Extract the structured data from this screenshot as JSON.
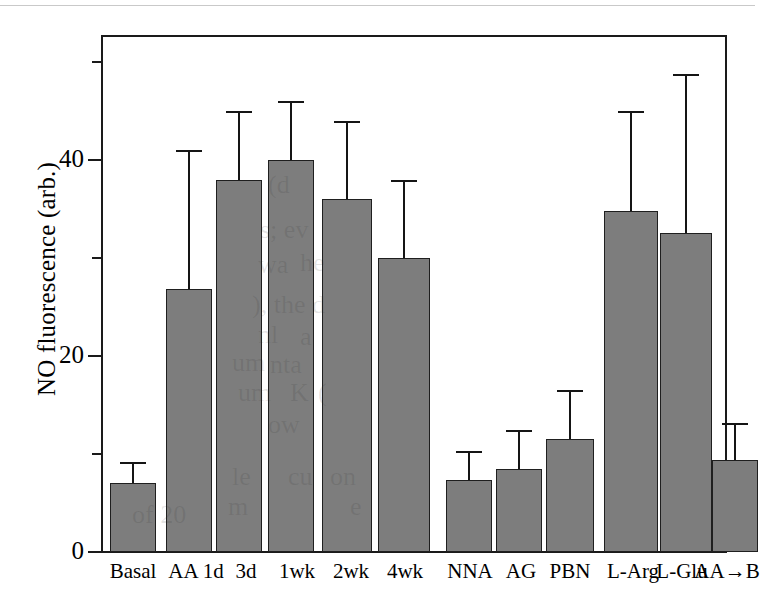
{
  "chart_data": {
    "type": "bar",
    "title": "",
    "xlabel": "",
    "ylabel": "NO fluorescence (arb.)",
    "ylim": [
      0,
      53
    ],
    "ytick_values": [
      0,
      20,
      40
    ],
    "ytick_labels": [
      "0",
      "20",
      "40"
    ],
    "yminor_tick_values": [
      10,
      30,
      50
    ],
    "grid": false,
    "legend": "none",
    "error_bars": "upper only (SEM/SD caps)",
    "groups": [
      {
        "name": "time-course",
        "categories": [
          "Basal",
          "AA 1d",
          "3d",
          "1wk",
          "2wk",
          "4wk"
        ],
        "values": [
          7.0,
          26.8,
          38.0,
          40.0,
          36.0,
          30.0
        ],
        "errors_upper": [
          9.2,
          41.0,
          45.0,
          46.0,
          44.0,
          38.0
        ]
      },
      {
        "name": "inhibitors",
        "categories": [
          "NNA",
          "AG",
          "PBN"
        ],
        "values": [
          7.3,
          8.5,
          11.5
        ],
        "errors_upper": [
          10.3,
          12.5,
          16.5
        ]
      },
      {
        "name": "substrates",
        "categories": [
          "L-Arg",
          "L-Glu",
          "AA→B"
        ],
        "values": [
          34.8,
          32.6,
          9.4
        ],
        "errors_upper": [
          45.0,
          48.8,
          13.2
        ]
      }
    ],
    "categories_all": [
      "Basal",
      "AA 1d",
      "3d",
      "1wk",
      "2wk",
      "4wk",
      "NNA",
      "AG",
      "PBN",
      "L-Arg",
      "L-Glu",
      "AA→B"
    ],
    "values_all": [
      7.0,
      26.8,
      38.0,
      40.0,
      36.0,
      30.0,
      7.3,
      8.5,
      11.5,
      34.8,
      32.6,
      9.4
    ],
    "errors_upper_all": [
      9.2,
      41.0,
      45.0,
      46.0,
      44.0,
      38.0,
      10.3,
      12.5,
      16.5,
      45.0,
      48.8,
      13.2
    ],
    "colors": {
      "bar_fill": "#7d7d7d",
      "bar_edge": "#1f1f1f",
      "axis": "#1a1a1a",
      "background": "#ffffff",
      "error_bar": "#151515"
    }
  },
  "xtick_labels": [
    {
      "text": "Basal",
      "center": 133
    },
    {
      "text": "AA 1d",
      "center": 196
    },
    {
      "text": "3d",
      "center": 246
    },
    {
      "text": "1wk",
      "center": 297
    },
    {
      "text": "2wk",
      "center": 351
    },
    {
      "text": "4wk",
      "center": 405
    },
    {
      "text": "NNA",
      "center": 470
    },
    {
      "text": "AG",
      "center": 521
    },
    {
      "text": "PBN",
      "center": 570
    },
    {
      "text": "L-Arg",
      "center": 633
    },
    {
      "text": "L-Glu",
      "center": 682
    },
    {
      "text": "AA→B",
      "center": 727
    }
  ],
  "ghost_text": [
    {
      "text": "of 20",
      "x": 132,
      "y": 500
    },
    {
      "text": "(d",
      "x": 268,
      "y": 170
    },
    {
      "text": "s; ev",
      "x": 260,
      "y": 215
    },
    {
      "text": "wa",
      "x": 258,
      "y": 250
    },
    {
      "text": "he",
      "x": 300,
      "y": 248
    },
    {
      "text": "), the d",
      "x": 252,
      "y": 290
    },
    {
      "text": "nl",
      "x": 258,
      "y": 320
    },
    {
      "text": "a",
      "x": 300,
      "y": 322
    },
    {
      "text": "um",
      "x": 232,
      "y": 348
    },
    {
      "text": "nta",
      "x": 270,
      "y": 350
    },
    {
      "text": "um",
      "x": 238,
      "y": 378
    },
    {
      "text": "K",
      "x": 290,
      "y": 378
    },
    {
      "text": "(",
      "x": 318,
      "y": 378
    },
    {
      "text": "ow",
      "x": 268,
      "y": 410
    },
    {
      "text": "le",
      "x": 232,
      "y": 462
    },
    {
      "text": "cu",
      "x": 288,
      "y": 462
    },
    {
      "text": "on",
      "x": 330,
      "y": 462
    },
    {
      "text": "m",
      "x": 228,
      "y": 492
    },
    {
      "text": "e",
      "x": 350,
      "y": 492
    }
  ]
}
